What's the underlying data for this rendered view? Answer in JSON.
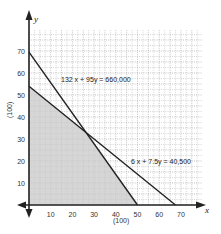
{
  "chart_data": {
    "type": "line",
    "title": "",
    "xlabel": "x",
    "ylabel": "y",
    "x_unit_label": "(100)",
    "y_unit_label": "(100)",
    "xlim": [
      0,
      80
    ],
    "ylim": [
      0,
      80
    ],
    "x_ticks": [
      10,
      20,
      30,
      40,
      50,
      60,
      70
    ],
    "y_ticks": [
      10,
      20,
      30,
      40,
      50,
      60,
      70
    ],
    "grid": true,
    "series": [
      {
        "name": "132x + 95y = 660,000",
        "label": "132 x + 95y = 660,000",
        "points": [
          [
            0,
            69.5
          ],
          [
            50,
            0
          ]
        ]
      },
      {
        "name": "6x + 7.5y = 40,500",
        "label": "6 x + 7.5y = 40,500",
        "points": [
          [
            0,
            54
          ],
          [
            67.5,
            0
          ]
        ]
      }
    ],
    "shaded_region": {
      "description": "feasible region",
      "vertices": [
        [
          0,
          0
        ],
        [
          0,
          54
        ],
        [
          26.25,
          33
        ],
        [
          50,
          0
        ]
      ]
    }
  },
  "labels": {
    "line1": "132 x + 95y = 660,000",
    "line2": "6 x + 7.5y = 40,500",
    "x_axis": "x",
    "y_axis": "y",
    "x_unit": "(100)",
    "y_unit": "(100)"
  },
  "colors": {
    "line": "#222222",
    "shade": "#c8c8c8",
    "grid": "#9a9a9a",
    "axis": "#222222"
  }
}
